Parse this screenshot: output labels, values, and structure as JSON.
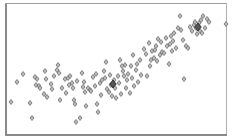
{
  "chart_data": {
    "type": "scatter",
    "title": "",
    "xlabel": "",
    "ylabel": "",
    "xlim": [
      0,
      1
    ],
    "ylim": [
      0,
      1
    ],
    "grid": false,
    "legend": null,
    "marker": {
      "shape": "diamond",
      "size": 4,
      "fill": "#b8b8b8",
      "stroke": "#6e6e6e"
    },
    "frame_color": "#8a8a8a",
    "plot_area_px": {
      "left": 7,
      "top": 4,
      "right": 226,
      "bottom": 134
    },
    "series": [
      {
        "name": "points",
        "points_px": [
          [
            11,
            102
          ],
          [
            17,
            82
          ],
          [
            23,
            74
          ],
          [
            30,
            103
          ],
          [
            32,
            118
          ],
          [
            35,
            77
          ],
          [
            37,
            79
          ],
          [
            36,
            85
          ],
          [
            39,
            86
          ],
          [
            40,
            88
          ],
          [
            45,
            71
          ],
          [
            46,
            79
          ],
          [
            44,
            94
          ],
          [
            47,
            97
          ],
          [
            51,
            84
          ],
          [
            52,
            89
          ],
          [
            54,
            76
          ],
          [
            57,
            70
          ],
          [
            58,
            65
          ],
          [
            59,
            73
          ],
          [
            60,
            100
          ],
          [
            62,
            88
          ],
          [
            65,
            79
          ],
          [
            66,
            93
          ],
          [
            68,
            78
          ],
          [
            69,
            85
          ],
          [
            70,
            76
          ],
          [
            72,
            83
          ],
          [
            73,
            88
          ],
          [
            74,
            100
          ],
          [
            75,
            104
          ],
          [
            77,
            81
          ],
          [
            76,
            122
          ],
          [
            80,
            118
          ],
          [
            82,
            73
          ],
          [
            83,
            87
          ],
          [
            84,
            82
          ],
          [
            85,
            92
          ],
          [
            86,
            106
          ],
          [
            88,
            88
          ],
          [
            90,
            90
          ],
          [
            91,
            91
          ],
          [
            93,
            77
          ],
          [
            95,
            86
          ],
          [
            96,
            74
          ],
          [
            97,
            104
          ],
          [
            98,
            112
          ],
          [
            100,
            83
          ],
          [
            101,
            95
          ],
          [
            102,
            80
          ],
          [
            104,
            71
          ],
          [
            105,
            78
          ],
          [
            106,
            62
          ],
          [
            107,
            89
          ],
          [
            109,
            92
          ],
          [
            110,
            75
          ],
          [
            111,
            85
          ],
          [
            112,
            96
          ],
          [
            113,
            84
          ],
          [
            114,
            80
          ],
          [
            115,
            88
          ],
          [
            116,
            98
          ],
          [
            118,
            76
          ],
          [
            119,
            83
          ],
          [
            120,
            60
          ],
          [
            121,
            94
          ],
          [
            122,
            66
          ],
          [
            123,
            71
          ],
          [
            124,
            76
          ],
          [
            125,
            65
          ],
          [
            126,
            88
          ],
          [
            127,
            80
          ],
          [
            128,
            74
          ],
          [
            130,
            93
          ],
          [
            131,
            66
          ],
          [
            132,
            78
          ],
          [
            133,
            55
          ],
          [
            134,
            86
          ],
          [
            136,
            70
          ],
          [
            137,
            64
          ],
          [
            138,
            82
          ],
          [
            140,
            60
          ],
          [
            141,
            75
          ],
          [
            144,
            49
          ],
          [
            146,
            54
          ],
          [
            147,
            76
          ],
          [
            149,
            43
          ],
          [
            150,
            66
          ],
          [
            151,
            60
          ],
          [
            152,
            51
          ],
          [
            154,
            58
          ],
          [
            155,
            50
          ],
          [
            156,
            46
          ],
          [
            157,
            61
          ],
          [
            158,
            39
          ],
          [
            160,
            55
          ],
          [
            161,
            42
          ],
          [
            162,
            52
          ],
          [
            164,
            53
          ],
          [
            166,
            38
          ],
          [
            167,
            46
          ],
          [
            169,
            64
          ],
          [
            170,
            44
          ],
          [
            171,
            36
          ],
          [
            172,
            51
          ],
          [
            173,
            41
          ],
          [
            174,
            33
          ],
          [
            176,
            48
          ],
          [
            178,
            28
          ],
          [
            180,
            16
          ],
          [
            181,
            30
          ],
          [
            183,
            40
          ],
          [
            184,
            79
          ],
          [
            186,
            46
          ],
          [
            188,
            48
          ],
          [
            190,
            27
          ],
          [
            192,
            31
          ],
          [
            194,
            25
          ],
          [
            195,
            22
          ],
          [
            196,
            28
          ],
          [
            197,
            34
          ],
          [
            198,
            27
          ],
          [
            199,
            23
          ],
          [
            200,
            31
          ],
          [
            201,
            20
          ],
          [
            202,
            33
          ],
          [
            203,
            16
          ],
          [
            205,
            28
          ],
          [
            207,
            19
          ],
          [
            209,
            22
          ],
          [
            226,
            24
          ]
        ],
        "highlight_points_px": [
          [
            113,
            84
          ],
          [
            198,
            27
          ]
        ]
      }
    ],
    "trend": "positive correlation; y increases with x"
  }
}
